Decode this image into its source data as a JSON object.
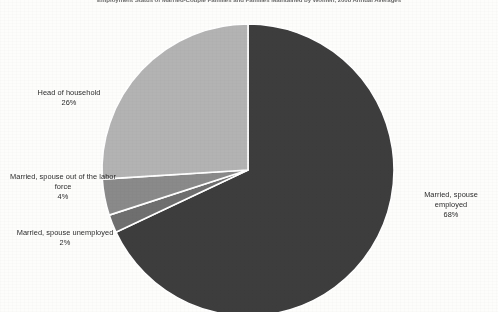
{
  "chart_data": {
    "type": "pie",
    "title": "Employment Status of Married-Couple Families and Families Maintained by Women, 2008 Annual Averages",
    "xlabel": "",
    "ylabel": "",
    "grid": false,
    "legend_position": "none",
    "categories": [
      "Married, spouse employed",
      "Married, spouse unemployed",
      "Married, spouse out of the labor force",
      "Head of household"
    ],
    "values": [
      68,
      2,
      4,
      26
    ],
    "value_labels": [
      "68%",
      "4%",
      "2%",
      "26%"
    ],
    "units": "percent",
    "start_angle_deg": 0,
    "direction": "clockwise",
    "slice_colors": [
      "#3d3d3d",
      "#6f6f6f",
      "#8a8a8a",
      "#b3b3b3"
    ],
    "annotations": []
  },
  "labels": {
    "head_of_household": {
      "name": "Head of household",
      "pct": "26%"
    },
    "spouse_out_of_labor_force": {
      "name": "Married, spouse out of the labor force",
      "pct": "4%"
    },
    "spouse_unemployed": {
      "name": "Married, spouse unemployed",
      "pct": "2%"
    },
    "spouse_employed": {
      "name": "Married, spouse employed",
      "pct": "68%"
    }
  },
  "colors": {
    "slice_employed": "#3d3d3d",
    "slice_unemployed": "#6f6f6f",
    "slice_out_of_lf": "#8a8a8a",
    "slice_head_household": "#b3b3b3",
    "separator": "#ffffff",
    "background": "#fdfdfc",
    "text": "#2b2b2b"
  }
}
